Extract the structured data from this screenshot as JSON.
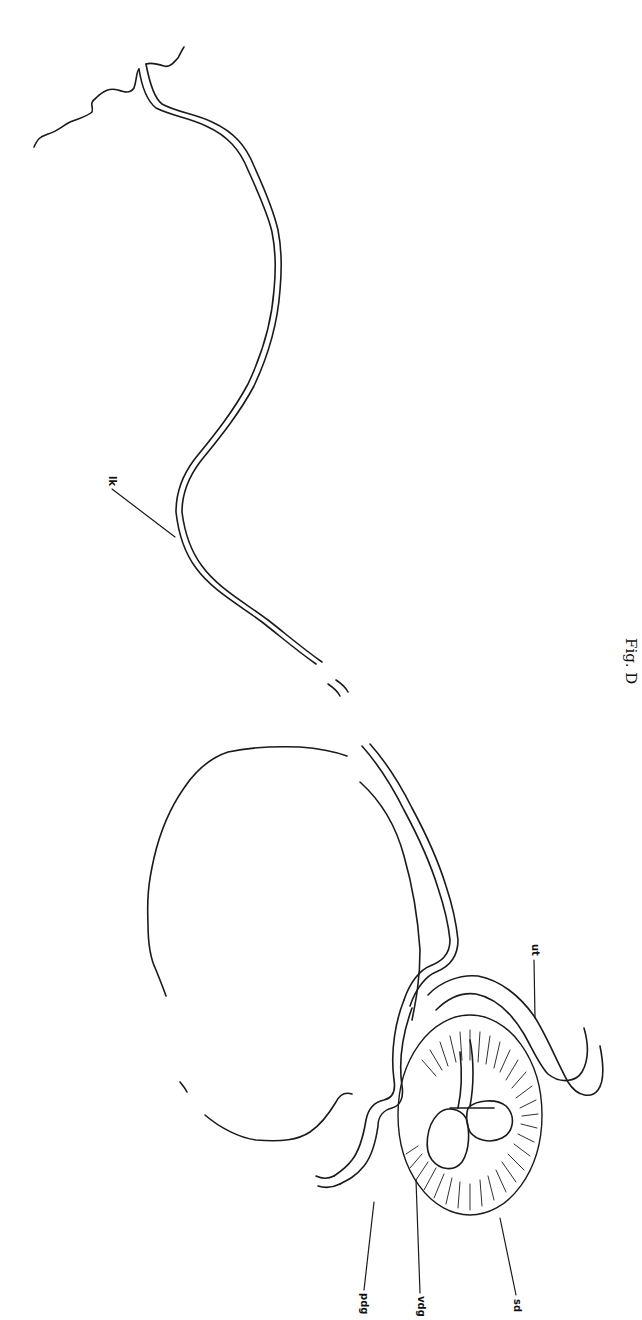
{
  "figure": {
    "caption": "Fig. D",
    "labels": [
      {
        "id": "lk",
        "text": "lk"
      },
      {
        "id": "ut",
        "text": "ut"
      },
      {
        "id": "sd",
        "text": "sd"
      },
      {
        "id": "vdg",
        "text": "vdg"
      },
      {
        "id": "pdg",
        "text": "pdg"
      }
    ],
    "colors": {
      "ink": "#1a1a1a",
      "paper": "#ffffff"
    }
  }
}
